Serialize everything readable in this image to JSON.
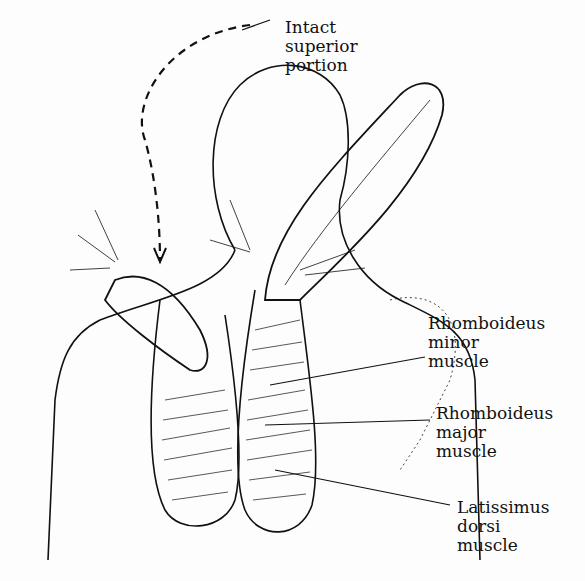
{
  "diagram": {
    "type": "anatomical illustration",
    "labels": [
      {
        "id": "intact-superior-portion",
        "lines": [
          "Intact",
          "superior",
          "portion"
        ]
      },
      {
        "id": "rhomboideus-minor",
        "lines": [
          "Rhomboideus",
          "minor",
          "muscle"
        ]
      },
      {
        "id": "rhomboideus-major",
        "lines": [
          "Rhomboideus",
          "major",
          "muscle"
        ]
      },
      {
        "id": "latissimus-dorsi",
        "lines": [
          "Latissimus",
          "dorsi",
          "muscle"
        ]
      }
    ],
    "colors": {
      "ink": "#111111",
      "background": "#fdfdfd"
    }
  }
}
